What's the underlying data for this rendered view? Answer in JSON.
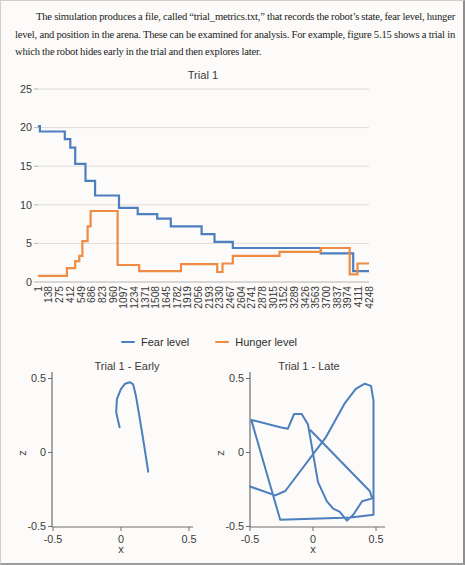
{
  "document": {
    "paragraph": "The simulation produces a file, called “trial_metrics.txt,” that records the robot’s state, fear level, hunger level, and position in the arena. These can be examined for analysis. For example, figure 5.15 shows a trial in which the robot hides early in the trial and then explores later."
  },
  "colors": {
    "fear": "#4d7ebd",
    "hunger": "#ee8b44",
    "trajectory": "#4d7ebd",
    "grid": "#dddcd9",
    "axis_light": "#b3b3b3",
    "axis_dark": "#6e6e6e",
    "label": "#3a3a3a"
  },
  "chart_data": [
    {
      "type": "line",
      "title": "Trial 1",
      "ylim": [
        0,
        25
      ],
      "y_ticks": [
        0,
        5,
        10,
        15,
        20,
        25
      ],
      "grid": true,
      "legend_position": "bottom",
      "x_categories": [
        1,
        138,
        275,
        412,
        549,
        686,
        823,
        960,
        1097,
        1234,
        1371,
        1508,
        1645,
        1782,
        1919,
        2056,
        2193,
        2330,
        2467,
        2604,
        2741,
        2878,
        3015,
        3152,
        3289,
        3426,
        3563,
        3700,
        3837,
        3974,
        4111,
        4248
      ],
      "series": [
        {
          "name": "Fear level",
          "color": "#4d7ebd",
          "step_points": [
            [
              1,
              20.2
            ],
            [
              25,
              19.5
            ],
            [
              345,
              18.5
            ],
            [
              415,
              17.4
            ],
            [
              478,
              15.3
            ],
            [
              611,
              13.1
            ],
            [
              733,
              11.2
            ],
            [
              1040,
              9.6
            ],
            [
              1280,
              8.8
            ],
            [
              1530,
              8.2
            ],
            [
              1705,
              7.2
            ],
            [
              2100,
              6.2
            ],
            [
              2265,
              5.2
            ],
            [
              2500,
              4.4
            ],
            [
              3630,
              3.7
            ],
            [
              4045,
              1.4
            ],
            [
              4248,
              1.4
            ]
          ]
        },
        {
          "name": "Hunger level",
          "color": "#ee8b44",
          "step_points": [
            [
              1,
              0.8
            ],
            [
              372,
              1.8
            ],
            [
              478,
              2.7
            ],
            [
              531,
              3.4
            ],
            [
              571,
              5.3
            ],
            [
              637,
              7.2
            ],
            [
              676,
              9.2
            ],
            [
              1022,
              2.2
            ],
            [
              1300,
              1.4
            ],
            [
              1836,
              2.3
            ],
            [
              2300,
              1.3
            ],
            [
              2368,
              2.4
            ],
            [
              2500,
              3.4
            ],
            [
              3100,
              3.9
            ],
            [
              3630,
              4.4
            ],
            [
              4000,
              1.0
            ],
            [
              4100,
              2.4
            ],
            [
              4248,
              2.4
            ]
          ]
        }
      ]
    },
    {
      "type": "line",
      "title": "Trial 1 - Early",
      "xlabel": "x",
      "ylabel": "z",
      "xlim": [
        -0.5,
        0.5
      ],
      "ylim": [
        -0.5,
        0.5
      ],
      "x_ticks": [
        -0.5,
        0,
        0.5
      ],
      "y_ticks": [
        -0.5,
        0,
        0.5
      ],
      "color": "#4d7ebd",
      "points": [
        [
          -0.01,
          0.17
        ],
        [
          -0.035,
          0.27
        ],
        [
          -0.03,
          0.36
        ],
        [
          0.0,
          0.43
        ],
        [
          0.03,
          0.465
        ],
        [
          0.065,
          0.475
        ],
        [
          0.09,
          0.46
        ],
        [
          0.11,
          0.38
        ],
        [
          0.14,
          0.22
        ],
        [
          0.17,
          0.05
        ],
        [
          0.2,
          -0.13
        ]
      ]
    },
    {
      "type": "line",
      "title": "Trial 1 - Late",
      "xlabel": "x",
      "ylabel": "z",
      "xlim": [
        -0.5,
        0.5
      ],
      "ylim": [
        -0.5,
        0.5
      ],
      "x_ticks": [
        -0.5,
        0,
        0.5
      ],
      "y_ticks": [
        -0.5,
        0,
        0.5
      ],
      "color": "#4d7ebd",
      "points": [
        [
          -0.5,
          -0.23
        ],
        [
          -0.3,
          -0.29
        ],
        [
          -0.22,
          -0.26
        ],
        [
          0.1,
          0.1
        ],
        [
          0.25,
          0.33
        ],
        [
          0.34,
          0.43
        ],
        [
          0.41,
          0.465
        ],
        [
          0.46,
          0.45
        ],
        [
          0.48,
          0.35
        ],
        [
          0.48,
          -0.42
        ],
        [
          0.3,
          -0.44
        ],
        [
          -0.26,
          -0.455
        ],
        [
          -0.49,
          0.22
        ],
        [
          -0.26,
          0.17
        ],
        [
          -0.2,
          0.16
        ],
        [
          -0.15,
          0.26
        ],
        [
          -0.09,
          0.26
        ],
        [
          -0.04,
          0.19
        ],
        [
          0.04,
          -0.2
        ],
        [
          0.11,
          -0.33
        ],
        [
          0.16,
          -0.38
        ],
        [
          0.21,
          -0.4
        ],
        [
          0.27,
          -0.46
        ],
        [
          0.32,
          -0.42
        ],
        [
          0.39,
          -0.33
        ],
        [
          0.47,
          -0.31
        ],
        [
          0.45,
          -0.26
        ],
        [
          -0.02,
          0.15
        ]
      ]
    }
  ]
}
